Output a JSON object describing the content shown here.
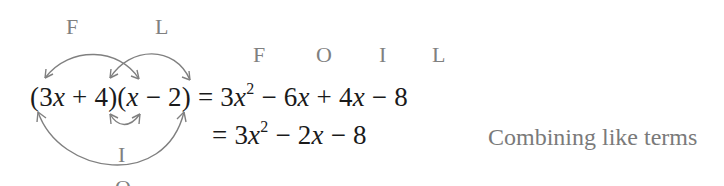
{
  "diagram": {
    "arc_labels": {
      "first": "F",
      "last": "L",
      "inner": "I",
      "outer": "O"
    },
    "column_labels": [
      "F",
      "O",
      "I",
      "L"
    ],
    "expression": {
      "factor1": {
        "open": "(",
        "coef": "3",
        "var": "x",
        "op": "+",
        "const": "4",
        "close": ")"
      },
      "factor2": {
        "open": "(",
        "var": "x",
        "op": "−",
        "const": "2",
        "close": ")"
      }
    },
    "lines": [
      {
        "equals": "=",
        "terms": [
          {
            "coef": "3",
            "var": "x",
            "exp": "2"
          },
          {
            "op": "−",
            "coef": "6",
            "var": "x"
          },
          {
            "op": "+",
            "coef": "4",
            "var": "x"
          },
          {
            "op": "−",
            "const": "8"
          }
        ],
        "note": ""
      },
      {
        "equals": "=",
        "terms": [
          {
            "coef": "3",
            "var": "x",
            "exp": "2"
          },
          {
            "op": "−",
            "coef": "2",
            "var": "x"
          },
          {
            "op": "−",
            "const": "8"
          }
        ],
        "note": "Combining like terms"
      }
    ],
    "colors": {
      "text": "#1a1a1a",
      "labels": "#808080",
      "arrows": "#808080",
      "note": "#7a7a7a"
    }
  }
}
